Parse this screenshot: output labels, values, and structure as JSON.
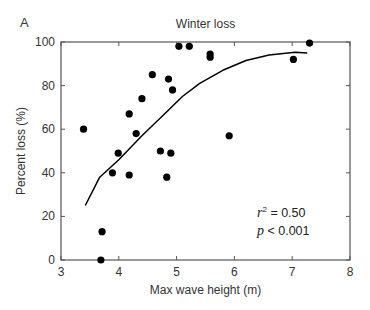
{
  "chart_data": {
    "type": "scatter",
    "panel_label": "A",
    "title": "Winter loss",
    "xlabel": "Max wave height (m)",
    "ylabel": "Percent loss (%)",
    "xlim": [
      3,
      8
    ],
    "ylim": [
      0,
      100
    ],
    "xticks": [
      3,
      4,
      5,
      6,
      7,
      8
    ],
    "yticks": [
      0,
      20,
      40,
      60,
      80,
      100
    ],
    "grid": false,
    "legend": null,
    "series": [
      {
        "name": "observations",
        "marker": "filled-circle",
        "color": "#000000",
        "points": [
          {
            "x": 3.39,
            "y": 60
          },
          {
            "x": 3.69,
            "y": 0
          },
          {
            "x": 3.71,
            "y": 13
          },
          {
            "x": 3.89,
            "y": 40
          },
          {
            "x": 3.99,
            "y": 49
          },
          {
            "x": 4.18,
            "y": 67
          },
          {
            "x": 4.18,
            "y": 39
          },
          {
            "x": 4.3,
            "y": 58
          },
          {
            "x": 4.4,
            "y": 74
          },
          {
            "x": 4.58,
            "y": 85
          },
          {
            "x": 4.72,
            "y": 50
          },
          {
            "x": 4.83,
            "y": 38
          },
          {
            "x": 4.86,
            "y": 83
          },
          {
            "x": 4.9,
            "y": 49
          },
          {
            "x": 4.93,
            "y": 78
          },
          {
            "x": 5.04,
            "y": 98
          },
          {
            "x": 5.22,
            "y": 98
          },
          {
            "x": 5.58,
            "y": 94.5
          },
          {
            "x": 5.58,
            "y": 93
          },
          {
            "x": 5.91,
            "y": 57
          },
          {
            "x": 7.02,
            "y": 92
          },
          {
            "x": 7.3,
            "y": 99.5
          }
        ]
      },
      {
        "name": "fit",
        "type": "line",
        "color": "#000000",
        "points": [
          {
            "x": 3.42,
            "y": 25
          },
          {
            "x": 3.67,
            "y": 38
          },
          {
            "x": 4.0,
            "y": 46
          },
          {
            "x": 4.4,
            "y": 57
          },
          {
            "x": 4.83,
            "y": 68
          },
          {
            "x": 5.1,
            "y": 75
          },
          {
            "x": 5.4,
            "y": 81
          },
          {
            "x": 5.8,
            "y": 87
          },
          {
            "x": 6.2,
            "y": 91.5
          },
          {
            "x": 6.6,
            "y": 94
          },
          {
            "x": 7.05,
            "y": 95.3
          },
          {
            "x": 7.26,
            "y": 95
          }
        ]
      }
    ],
    "annotations": [
      {
        "text": "r² = 0.50",
        "x": 6.7,
        "y": 17
      },
      {
        "text": "p < 0.001",
        "x": 6.7,
        "y": 9
      }
    ]
  },
  "stats": {
    "r_symbol": "r",
    "r_sup": "2",
    "r_value": " = 0.50",
    "p_symbol": "p",
    "p_value": " < 0.001"
  }
}
